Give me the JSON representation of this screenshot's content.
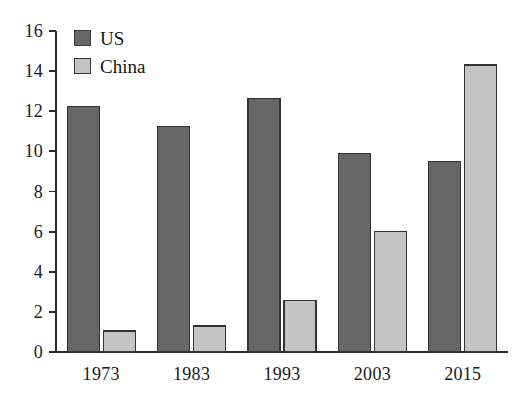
{
  "chart_data": {
    "type": "bar",
    "title": "",
    "subtitle": "",
    "xlabel": "",
    "ylabel": "",
    "categories": [
      "1973",
      "1983",
      "1993",
      "2003",
      "2015"
    ],
    "series": [
      {
        "name": "US",
        "color": "#666666",
        "values": [
          12.25,
          11.25,
          12.65,
          9.9,
          9.5
        ]
      },
      {
        "name": "China",
        "color": "#c4c4c4",
        "values": [
          1.05,
          1.3,
          2.55,
          6.0,
          14.3
        ]
      }
    ],
    "ylim": [
      0,
      16
    ],
    "yticks": [
      0,
      2,
      4,
      6,
      8,
      10,
      12,
      14,
      16
    ],
    "ytick_labels": [
      "0",
      "2",
      "4",
      "6",
      "8",
      "10",
      "12",
      "14",
      "16"
    ],
    "grid": false,
    "legend_position": "top-left",
    "annotations": []
  },
  "legend": {
    "entries": [
      {
        "label": "US",
        "swatch": "legend-swatch-us",
        "color": "#666666"
      },
      {
        "label": "China",
        "swatch": "legend-swatch-china",
        "color": "#c4c4c4"
      }
    ]
  },
  "axis": {
    "tick_color": "#2b2b2b",
    "axis_color": "#2b2b2b"
  }
}
